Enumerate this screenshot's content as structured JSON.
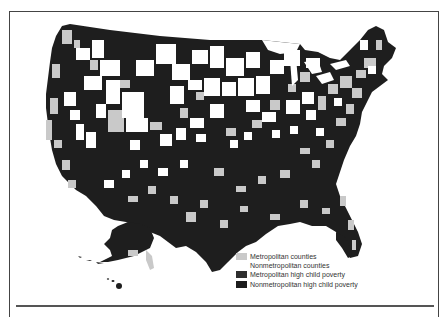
{
  "map": {
    "subject": "United States counties, high child poverty by metropolitan status",
    "regions_shown": [
      "Contiguous United States",
      "Alaska",
      "Hawaii"
    ]
  },
  "legend": {
    "items": [
      {
        "label": "Metropolitan counties",
        "color": "#c9c9c9"
      },
      {
        "label": "Nonmetropolitan counties",
        "color": "#ffffff"
      },
      {
        "label": "Metropolitan high child poverty",
        "color": "#2e2e2e"
      },
      {
        "label": "Nonmetropolitan high child poverty",
        "color": "#1c1c1c"
      }
    ]
  },
  "colors": {
    "dark": "#1e1e1e",
    "light": "#c9c9c9",
    "white": "#ffffff",
    "border": "#444444"
  }
}
